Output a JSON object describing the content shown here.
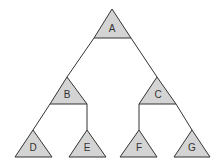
{
  "diagram": {
    "type": "tree",
    "colors": {
      "node_fill": "#d4d4d4",
      "stroke": "#333333",
      "background": "#ffffff"
    },
    "nodes": [
      {
        "id": "A",
        "label": "A",
        "apex": [
          112,
          9
        ],
        "base_y": 38,
        "left": 94,
        "right": 131
      },
      {
        "id": "B",
        "label": "B",
        "apex": [
          67,
          77
        ],
        "base_y": 104,
        "left": 50,
        "right": 87
      },
      {
        "id": "C",
        "label": "C",
        "apex": [
          157,
          77
        ],
        "base_y": 104,
        "left": 139,
        "right": 176
      },
      {
        "id": "D",
        "label": "D",
        "apex": [
          33,
          130
        ],
        "base_y": 157,
        "left": 15,
        "right": 52
      },
      {
        "id": "E",
        "label": "E",
        "apex": [
          87,
          130
        ],
        "base_y": 157,
        "left": 69,
        "right": 106
      },
      {
        "id": "F",
        "label": "F",
        "apex": [
          138,
          130
        ],
        "base_y": 157,
        "left": 120,
        "right": 157
      },
      {
        "id": "G",
        "label": "G",
        "apex": [
          192,
          130
        ],
        "base_y": 157,
        "left": 174,
        "right": 210
      }
    ],
    "edges": [
      {
        "from": "A",
        "to": "B"
      },
      {
        "from": "A",
        "to": "C"
      },
      {
        "from": "B",
        "to": "D"
      },
      {
        "from": "B",
        "to": "E"
      },
      {
        "from": "C",
        "to": "F"
      },
      {
        "from": "C",
        "to": "G"
      }
    ]
  }
}
